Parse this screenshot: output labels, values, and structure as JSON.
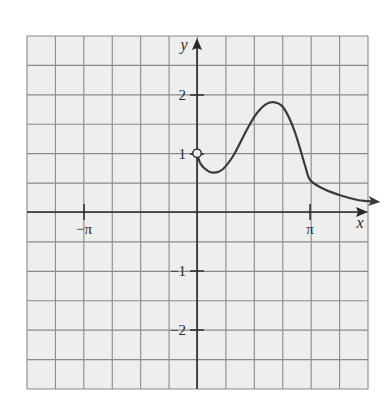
{
  "chart_data": {
    "type": "line",
    "title": "",
    "xlabel": "x",
    "ylabel": "y",
    "xlim": [
      -4.712,
      4.712
    ],
    "ylim": [
      -3.0,
      3.0
    ],
    "grid": true,
    "x_ticks": [
      {
        "value": -3.14159,
        "label": "−π"
      },
      {
        "value": 3.14159,
        "label": "π"
      }
    ],
    "y_ticks": [
      {
        "value": 2,
        "label": "2"
      },
      {
        "value": 1,
        "label": "1"
      },
      {
        "value": -1,
        "label": "−1"
      },
      {
        "value": -2,
        "label": "−2"
      }
    ],
    "series": [
      {
        "name": "f(x)",
        "x": [
          0,
          0.1,
          0.3,
          0.47,
          0.7,
          1.0,
          1.3,
          1.6,
          1.9,
          2.14,
          2.4,
          2.7,
          3.0,
          3.14,
          3.5,
          4.0,
          4.5,
          4.93
        ],
        "values": [
          1.0,
          0.82,
          0.7,
          0.67,
          0.72,
          0.95,
          1.3,
          1.63,
          1.83,
          1.87,
          1.78,
          1.4,
          0.8,
          0.55,
          0.4,
          0.28,
          0.2,
          0.18
        ],
        "x_domain_start": 0,
        "start_marker": "open-circle",
        "end_marker": "arrow"
      }
    ],
    "annotations": [
      {
        "type": "open-circle",
        "x": 0,
        "y": 1
      },
      {
        "type": "arrow",
        "at": "end of curve, continuing right"
      }
    ]
  },
  "labels": {
    "x_axis": "x",
    "y_axis": "y",
    "neg_pi": "−π",
    "pi": "π",
    "y2": "2",
    "y1": "1",
    "ym1": "−1",
    "ym2": "−2"
  },
  "colors": {
    "grid": "#8a8a8a",
    "paper": "#eeeeee",
    "axis": "#2a2a2a",
    "curve": "#3a3a3a"
  }
}
